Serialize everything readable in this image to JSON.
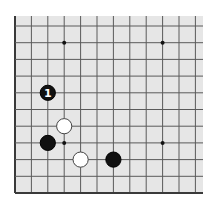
{
  "diagram": {
    "board_color": "#e6e6e6",
    "line_color": "#5a5a5a",
    "edge_color": "#3a3a3a",
    "origin": {
      "x": 15,
      "y": 193
    },
    "spacing": {
      "x": 16.4,
      "y": 16.7
    },
    "columns": 12,
    "rows": 11,
    "extent": {
      "left": 15,
      "top": 16,
      "right": 203,
      "bottom": 193
    },
    "star_points": [
      {
        "col": 3,
        "row": 9
      },
      {
        "col": 9,
        "row": 9
      },
      {
        "col": 3,
        "row": 3
      },
      {
        "col": 9,
        "row": 3
      }
    ],
    "stones": [
      {
        "color": "black",
        "col": 2,
        "row": 6,
        "label": "1"
      },
      {
        "color": "white",
        "col": 3,
        "row": 4,
        "label": ""
      },
      {
        "color": "black",
        "col": 2,
        "row": 3,
        "label": ""
      },
      {
        "color": "white",
        "col": 4,
        "row": 2,
        "label": ""
      },
      {
        "color": "black",
        "col": 6,
        "row": 2,
        "label": ""
      }
    ]
  }
}
